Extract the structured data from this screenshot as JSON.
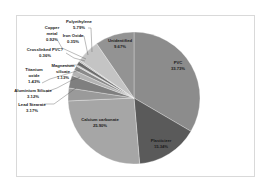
{
  "chart_data": {
    "type": "pie",
    "title": "",
    "categories": [
      "PVC",
      "Plasticizer",
      "Calcium carbonate",
      "Lead Stearate",
      "Aluminium Silicate",
      "Titanium oxide",
      "Magnesium silicate",
      "Crosslinked PVC?",
      "Copper metal",
      "Iron Oxide",
      "Polyethylene",
      "Unidentified"
    ],
    "values": [
      33.73,
      15.34,
      25.9,
      3.17,
      3.12,
      1.43,
      1.13,
      0.36,
      0.92,
      0.35,
      5.79,
      9.67
    ],
    "labels": [
      "PVC 33.73%",
      "Plasticizer 15.34%",
      "Calcium carbonate 25.90%",
      "Lead Stearate 3.17%",
      "Aluminium Silicate 3.12%",
      "Titanium oxide 1.43%",
      "Magnesium silicate 1.13%",
      "Crosslinked PVC? 0.36%",
      "Copper metal 0.92%",
      "Iron Oxide 0.35%",
      "Polyethylene 5.79%",
      "Unidentified 9.67%"
    ],
    "colors": [
      "#8c8c8c",
      "#5a5a5a",
      "#a6a6a6",
      "#9a9a9a",
      "#7f7f7f",
      "#b3b3b3",
      "#8a8a8a",
      "#cfcfcf",
      "#6e6e6e",
      "#bdbdbd",
      "#c4c4c4",
      "#939393"
    ],
    "legend": "none",
    "grid": false
  },
  "chart": {
    "slice_labels": [
      {
        "name": "PVC",
        "pct": "33.73%"
      },
      {
        "name": "Plasticizer",
        "pct": "15.34%"
      },
      {
        "name": "Calcium carbonate",
        "pct": "25.90%"
      },
      {
        "name": "Lead Stearate",
        "pct": "3.17%"
      },
      {
        "name": "Aluminium Silicate",
        "pct": "3.12%"
      },
      {
        "name": "Titanium",
        "name2": "oxide",
        "pct": "1.43%"
      },
      {
        "name": "Magnesium",
        "name2": "silicate",
        "pct": "1.13%"
      },
      {
        "name": "Crosslinked PVC?",
        "pct": "0.36%"
      },
      {
        "name": "Copper",
        "name2": "metal",
        "pct": "0.92%"
      },
      {
        "name": "Iron Oxide",
        "pct": "0.35%"
      },
      {
        "name": "Polyethylene",
        "pct": "5.79%"
      },
      {
        "name": "Unidentified",
        "pct": "9.67%"
      }
    ]
  }
}
